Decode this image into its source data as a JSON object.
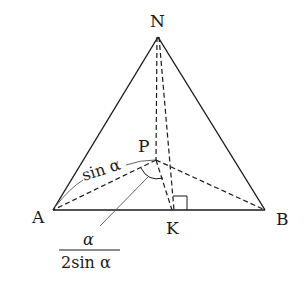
{
  "diagram": {
    "type": "geometry-tetrahedron",
    "points": {
      "N": {
        "label": "N",
        "x": 158,
        "y": 37
      },
      "A": {
        "label": "A",
        "x": 53,
        "y": 210
      },
      "B": {
        "label": "B",
        "x": 265,
        "y": 210
      },
      "K": {
        "label": "K",
        "x": 174,
        "y": 210
      },
      "P": {
        "label": "P",
        "x": 157,
        "y": 160
      }
    },
    "solid_edges": [
      "N-A",
      "N-B",
      "A-B"
    ],
    "dashed_edges": [
      "N-P",
      "N-K",
      "P-A",
      "P-B",
      "P-K"
    ],
    "right_angle_at": "K",
    "annotations": {
      "edge_PA_label": "sin α",
      "angle_label_numerator": "α",
      "angle_label_denominator": "2sin α"
    },
    "colors": {
      "line": "#1a1a1a",
      "leader": "#555555",
      "background": "#ffffff"
    }
  }
}
